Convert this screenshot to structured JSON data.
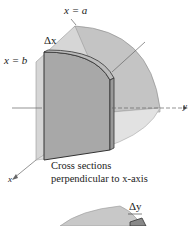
{
  "figure_top": {
    "labels": {
      "x_eq_a": "x = a",
      "x_eq_b": "x = b",
      "delta_x": "Δx",
      "y_axis": "y",
      "x_axis": "x"
    },
    "caption_line1": "Cross sections",
    "caption_line2": "perpendicular to x-axis"
  },
  "figure_bottom": {
    "labels": {
      "delta_y": "Δy"
    }
  }
}
